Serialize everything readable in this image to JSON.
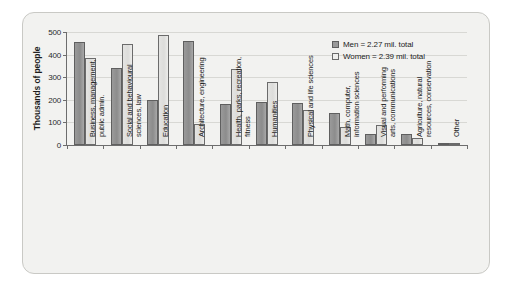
{
  "chart_data": {
    "type": "bar",
    "title": "",
    "subtitle": "",
    "xlabel": "",
    "ylabel": "Thousands of people",
    "ylim": [
      0,
      500
    ],
    "yticks": [
      0,
      100,
      200,
      300,
      400,
      500
    ],
    "ytick_labels": [
      "0",
      "100",
      "200",
      "300",
      "400",
      "500"
    ],
    "grid": true,
    "legend_position": "top-right",
    "categories": [
      "Business, management, public admin.",
      "Social and behavioural sciences, law",
      "Education",
      "Architecture, engineering",
      "Health, parks, recreation, fitness",
      "Humanities",
      "Physical and life sciences",
      "Math, computer, information sciences",
      "Visual and performing arts, communications",
      "Agriculture, natural resources, conservation",
      "Other"
    ],
    "category_lines": [
      [
        "Business, management,",
        "public admin."
      ],
      [
        "Social and behavioural",
        "sciences, law"
      ],
      [
        "Education",
        ""
      ],
      [
        "Architecture, engineering",
        ""
      ],
      [
        "Health, parks, recreation,",
        "fitness"
      ],
      [
        "Humanities",
        ""
      ],
      [
        "Physical and life sciences",
        ""
      ],
      [
        "Math, computer,",
        "information sciences"
      ],
      [
        "Visual and performing",
        "arts, communications"
      ],
      [
        "Agriculture, natural",
        "resources, conservation"
      ],
      [
        "Other",
        ""
      ]
    ],
    "series": [
      {
        "name": "Men",
        "legend_label": "Men = 2.27 mil. total",
        "total": "2.27 mil.",
        "color": "#9a9a9a",
        "values": [
          456,
          342,
          200,
          462,
          180,
          190,
          187,
          142,
          50,
          50,
          8
        ]
      },
      {
        "name": "Women",
        "legend_label": "Women = 2.39 mil. total",
        "total": "2.39 mil.",
        "color": "#ececea",
        "values": [
          387,
          446,
          489,
          95,
          338,
          280,
          153,
          78,
          88,
          30,
          5
        ]
      }
    ]
  },
  "legend": {
    "men_label": "Men = 2.27 mil. total",
    "women_label": "Women = 2.39 mil. total"
  },
  "axes": {
    "y_title": "Thousands of people"
  },
  "colors": {
    "men_fill": "#9a9a9a",
    "men_stroke": "#5f5f5f",
    "women_fill": "#ececea",
    "women_stroke": "#6b6b6b",
    "axis": "#6d6d6d",
    "grid": "#d8d8d4",
    "panel_bg": "#f2f2f0",
    "panel_border": "#c9c9c5",
    "text": "#1c1c1c"
  }
}
